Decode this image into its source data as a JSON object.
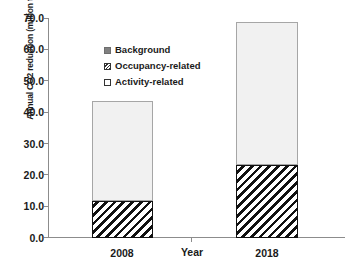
{
  "chart_data": {
    "type": "bar",
    "stacked": true,
    "title": "",
    "xlabel": "Year",
    "ylabel": "Annual CO2 reduction (million tons/year)",
    "categories": [
      "2008",
      "2018"
    ],
    "ylim": [
      0.0,
      70.0
    ],
    "yticks": [
      "0.0",
      "10.0",
      "20.0",
      "30.0",
      "40.0",
      "50.0",
      "60.0",
      "70.0"
    ],
    "ytick_values": [
      0.0,
      10.0,
      20.0,
      30.0,
      40.0,
      50.0,
      60.0,
      70.0
    ],
    "grid": false,
    "legend_position": "upper-left-inside",
    "series": [
      {
        "name": "Activity-related",
        "values": [
          11.8,
          23.3
        ],
        "fill": "diagonal-hatch"
      },
      {
        "name": "Occupancy-related",
        "values": [
          31.7,
          45.4
        ],
        "fill": "light-gray"
      },
      {
        "name": "Background",
        "values": [
          0.0,
          0.0
        ],
        "fill": "solid-gray"
      }
    ],
    "stack_totals": [
      43.5,
      68.7
    ]
  },
  "legend": {
    "entries": [
      {
        "label": "Background",
        "swatch": "solid-gray-square-icon"
      },
      {
        "label": "Occupancy-related",
        "swatch": "hatched-square-icon"
      },
      {
        "label": "Activity-related",
        "swatch": "white-square-icon"
      }
    ]
  },
  "axes": {
    "y_title": "Annual CO2 reduction (million tons/year)",
    "x_title": "Year",
    "y_tick_labels": [
      "70.0",
      "60.0",
      "50.0",
      "40.0",
      "30.0",
      "20.0",
      "10.0",
      "0.0"
    ],
    "x_tick_labels": [
      "2008",
      "2018"
    ]
  },
  "colors": {
    "background_fill": "#f1f1f1",
    "hatch_stroke": "#111111",
    "bar_border": "#a6a6a6",
    "axis_line": "#8c8c8c",
    "text": "#1a1a1a",
    "legend_solid": "#808080"
  }
}
